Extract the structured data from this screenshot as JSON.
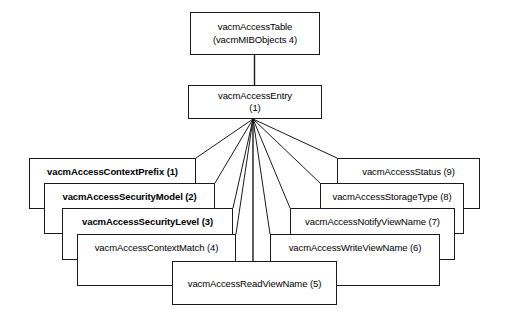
{
  "diagram": {
    "title": "vacmAccessTable",
    "root": {
      "name": "vacmAccessTable",
      "parent_ref": "(vacmMIBObjects 4)"
    },
    "entry": {
      "name": "vacmAccessEntry",
      "index": "(1)"
    },
    "columns": [
      {
        "label": "vacmAccessContextPrefix (1)",
        "name": "vacmAccessContextPrefix",
        "index": 1,
        "bold": true,
        "side": "left"
      },
      {
        "label": "vacmAccessSecurityModel (2)",
        "name": "vacmAccessSecurityModel",
        "index": 2,
        "bold": true,
        "side": "left"
      },
      {
        "label": "vacmAccessSecurityLevel (3)",
        "name": "vacmAccessSecurityLevel",
        "index": 3,
        "bold": true,
        "side": "left"
      },
      {
        "label": "vacmAccessContextMatch (4)",
        "name": "vacmAccessContextMatch",
        "index": 4,
        "bold": false,
        "side": "left"
      },
      {
        "label": "vacmAccessReadViewName (5)",
        "name": "vacmAccessReadViewName",
        "index": 5,
        "bold": false,
        "side": "center"
      },
      {
        "label": "vacmAccessWriteViewName (6)",
        "name": "vacmAccessWriteViewName",
        "index": 6,
        "bold": false,
        "side": "right"
      },
      {
        "label": "vacmAccessNotifyViewName (7)",
        "name": "vacmAccessNotifyViewName",
        "index": 7,
        "bold": false,
        "side": "right"
      },
      {
        "label": "vacmAccessStorageType (8)",
        "name": "vacmAccessStorageType",
        "index": 8,
        "bold": false,
        "side": "right"
      },
      {
        "label": "vacmAccessStatus (9)",
        "name": "vacmAccessStatus",
        "index": 9,
        "bold": false,
        "side": "right"
      }
    ],
    "colors": {
      "stroke": "#1a1a1a",
      "background": "#ffffff",
      "text": "#000000"
    }
  }
}
